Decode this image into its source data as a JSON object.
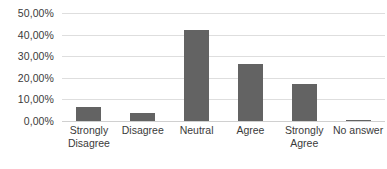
{
  "chart_data": {
    "type": "bar",
    "title": "",
    "subtitle": "",
    "xlabel": "",
    "ylabel": "",
    "categories": [
      "Strongly Disagree",
      "Disagree",
      "Neutral",
      "Agree",
      "Strongly Agree",
      "No answer"
    ],
    "values": [
      6.5,
      3.8,
      42.0,
      26.5,
      17.0,
      0.6
    ],
    "ylim": [
      0,
      50
    ],
    "ytick_values": [
      0,
      10,
      20,
      30,
      40,
      50
    ],
    "ytick_labels": [
      "0,00%",
      "10,00%",
      "20,00%",
      "30,00%",
      "40,00%",
      "50,00%"
    ],
    "grid": true,
    "grid_axis": "y",
    "legend": false,
    "legend_position": "none",
    "bar_color": "#636363",
    "gridline_color": "#dedede",
    "background_color": "#ffffff",
    "text_color": "#3a3a3a",
    "series": [
      {
        "name": "Responses",
        "values": [
          6.5,
          3.8,
          42.0,
          26.5,
          17.0,
          0.6
        ]
      }
    ]
  }
}
